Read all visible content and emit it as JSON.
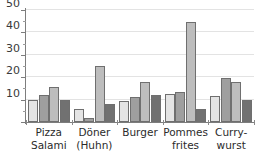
{
  "chart_data": {
    "type": "bar",
    "title": "",
    "xlabel": "",
    "ylabel": "",
    "ylim": [
      0,
      50
    ],
    "yticks": [
      0,
      10,
      20,
      30,
      40,
      50
    ],
    "ytick_labels": [
      "",
      "10",
      "20",
      "30",
      "40",
      "50"
    ],
    "minor_ticks": [
      5,
      15,
      25,
      35,
      45
    ],
    "grid": true,
    "grid_axis": "y",
    "legend": "none",
    "categories": [
      "Pizza Salami",
      "Döner (Huhn)",
      "Burger",
      "Pommes frites",
      "Curry-wurst"
    ],
    "category_lines": [
      [
        "Pizza",
        "Salami"
      ],
      [
        "Döner",
        "(Huhn)"
      ],
      [
        "Burger",
        ""
      ],
      [
        "Pommes",
        "frites"
      ],
      [
        "Curry-",
        "wurst"
      ]
    ],
    "series": [
      {
        "name": "series-1",
        "color": "#e4e4e4",
        "values": [
          10.0,
          6.0,
          9.5,
          12.5,
          11.5
        ]
      },
      {
        "name": "series-2",
        "color": "#9f9f9f",
        "values": [
          12.0,
          2.0,
          11.0,
          13.5,
          19.5
        ]
      },
      {
        "name": "series-3",
        "color": "#bdbdbd",
        "values": [
          15.5,
          25.0,
          18.0,
          44.5,
          18.0
        ]
      },
      {
        "name": "series-4",
        "color": "#717171",
        "values": [
          10.0,
          8.0,
          12.0,
          6.0,
          9.8
        ]
      }
    ]
  },
  "colors": {
    "axis": "#7d7d7d",
    "grid": "#e3e3e3",
    "text": "#2b2b2b",
    "background": "#ffffff"
  },
  "title_fragment": ""
}
